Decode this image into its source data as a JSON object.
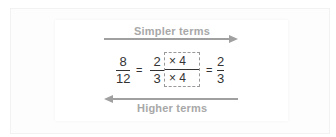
{
  "diagram": {
    "top_label": "Simpler terms",
    "bottom_label": "Higher terms",
    "equation": {
      "frac1": {
        "num": "8",
        "den": "12"
      },
      "eq1": "=",
      "frac2": {
        "num": "2",
        "den": "3"
      },
      "mult_top": "× 4",
      "mult_bottom": "× 4",
      "eq2": "=",
      "frac3": {
        "num": "2",
        "den": "3"
      }
    },
    "colors": {
      "arrow": "#a0a0a0",
      "label": "#a8a8a8",
      "text": "#333333"
    }
  }
}
